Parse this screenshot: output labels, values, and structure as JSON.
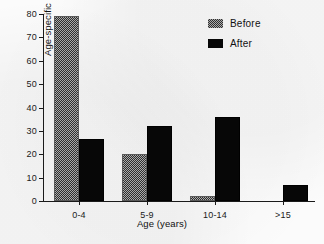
{
  "chart_data": {
    "type": "bar",
    "title": "",
    "subtitle": "",
    "xlabel": "Age (years)",
    "ylabel": "Age-specific incidence (%)",
    "categories": [
      "0-4",
      "5-9",
      "10-14",
      ">15"
    ],
    "series": [
      {
        "name": "Before",
        "values": [
          79,
          20,
          2,
          0
        ],
        "color": "#a9a9a9",
        "fill": "dithered-gray"
      },
      {
        "name": "After",
        "values": [
          26.5,
          32,
          36,
          7
        ],
        "color": "#070707",
        "fill": "solid-black"
      }
    ],
    "ylim": [
      0,
      80
    ],
    "yticks": [
      0,
      10,
      20,
      30,
      40,
      50,
      60,
      70,
      80
    ],
    "ytick_labels": [
      "0",
      "10",
      "20",
      "30",
      "40",
      "50",
      "60",
      "70",
      "80"
    ],
    "grid": false,
    "legend_position": "top-right",
    "legend_entries": [
      "Before",
      "After"
    ]
  },
  "axis": {
    "y_title": "Age-specific incidence (%)",
    "x_title": "Age (years)"
  }
}
